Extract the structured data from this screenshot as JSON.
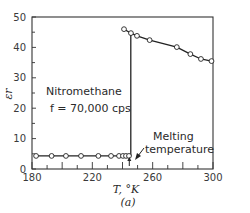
{
  "chart_data": {
    "type": "line",
    "title": "",
    "xlabel": "T, °K",
    "ylabel": "εr",
    "panel_label": "(a)",
    "xlim": [
      180,
      300
    ],
    "ylim": [
      0,
      50
    ],
    "xticks": [
      180,
      220,
      260,
      300
    ],
    "yticks": [
      0,
      10,
      20,
      30,
      40,
      50
    ],
    "grid": false,
    "legend": null,
    "annotations": [
      {
        "text": "Nitromethane",
        "x": 186,
        "y": 25
      },
      {
        "text": "f = 70,000 cps",
        "x": 186,
        "y": 20
      },
      {
        "text": "Melting temperature",
        "x": 252,
        "y": 7,
        "arrow_to": [
          244.5,
          2
        ]
      }
    ],
    "series": [
      {
        "name": "Solid (below melting)",
        "x": [
          182.7,
          193,
          202.5,
          212.5,
          224,
          232.4,
          237.7,
          240.3,
          242.3,
          244.3
        ],
        "y": [
          4.3,
          4.3,
          4.3,
          4.3,
          4.3,
          4.3,
          4.3,
          4.3,
          4.3,
          4.3
        ]
      },
      {
        "name": "Liquid (above melting)",
        "x": [
          241,
          245.6,
          249.6,
          258,
          276,
          285,
          292,
          299
        ],
        "y": [
          46,
          44.7,
          43.8,
          42.4,
          40.1,
          37.8,
          36.2,
          35.5
        ]
      }
    ],
    "transition": {
      "x": 245.5,
      "y_from": 4.3,
      "y_to": 44.7
    }
  },
  "labels": {
    "ylabel": "εr",
    "xlabel": "T, °K",
    "panel": "(a)",
    "substance": "Nitromethane",
    "frequency": "f = 70,000 cps",
    "melting_line1": "Melting",
    "melting_line2": "temperature"
  }
}
